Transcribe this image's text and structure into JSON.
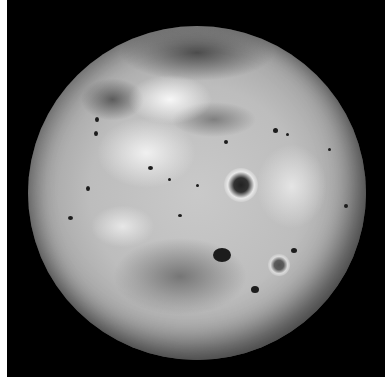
{
  "image": {
    "subject": "Io (moon of Jupiter), full-disk grayscale view",
    "background_color": "#000000",
    "border_color": "#ffffff",
    "surface_palette": [
      "#f2f2f2",
      "#bdbdbd",
      "#7a7a7a",
      "#1c1c1c"
    ],
    "features": [
      {
        "name": "bright-northern-region"
      },
      {
        "name": "dark-southern-region"
      },
      {
        "name": "ringed-volcanic-crater"
      },
      {
        "name": "scattered-dark-volcanic-spots"
      }
    ]
  }
}
